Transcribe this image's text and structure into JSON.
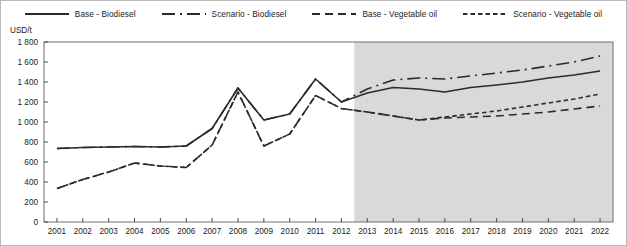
{
  "chart_data": {
    "type": "line",
    "title": "",
    "xlabel": "",
    "ylabel": "USD/t",
    "ylim": [
      0,
      1800
    ],
    "ytick_step": 200,
    "yticks": [
      "0",
      "200",
      "400",
      "600",
      "800",
      "1 000",
      "1 200",
      "1 400",
      "1 600",
      "1 800"
    ],
    "grid": false,
    "legend_position": "top",
    "x": [
      2001,
      2002,
      2003,
      2004,
      2005,
      2006,
      2007,
      2008,
      2009,
      2010,
      2011,
      2012,
      2013,
      2014,
      2015,
      2016,
      2017,
      2018,
      2019,
      2020,
      2021,
      2022
    ],
    "xtick_labels": [
      "2001",
      "2002",
      "2003",
      "2004",
      "2005",
      "2006",
      "2007",
      "2008",
      "2009",
      "2010",
      "2011",
      "2012",
      "2013",
      "2014",
      "2015",
      "2016",
      "2017",
      "2018",
      "2019",
      "2020",
      "2021",
      "2022"
    ],
    "projection_start_year": 2012.5,
    "projection_shading_color": "#d9d9d9",
    "line_color": "#2b2b2b",
    "series": [
      {
        "name": "Base - Biodiesel",
        "style": "solid",
        "values": [
          735,
          745,
          750,
          755,
          750,
          760,
          935,
          1340,
          1020,
          1080,
          1430,
          1200,
          1290,
          1345,
          1330,
          1300,
          1345,
          1370,
          1400,
          1440,
          1470,
          1510
        ]
      },
      {
        "name": "Scenario - Biodiesel",
        "style": "dashdot",
        "values": [
          735,
          745,
          750,
          755,
          750,
          760,
          935,
          1340,
          1020,
          1080,
          1430,
          1200,
          1330,
          1420,
          1440,
          1430,
          1460,
          1490,
          1520,
          1560,
          1600,
          1660
        ]
      },
      {
        "name": "Base - Vegetable oil",
        "style": "longdash",
        "values": [
          335,
          425,
          500,
          590,
          560,
          545,
          770,
          1300,
          760,
          880,
          1265,
          1135,
          1100,
          1060,
          1020,
          1040,
          1050,
          1060,
          1080,
          1100,
          1130,
          1160
        ]
      },
      {
        "name": "Scenario - Vegetable oil",
        "style": "shortdash",
        "values": [
          335,
          425,
          500,
          590,
          560,
          545,
          770,
          1300,
          760,
          880,
          1265,
          1135,
          1100,
          1060,
          1020,
          1050,
          1080,
          1110,
          1150,
          1190,
          1230,
          1280
        ]
      }
    ]
  },
  "legend": {
    "items": [
      {
        "label": "Base - Biodiesel",
        "style": "solid"
      },
      {
        "label": "Scenario - Biodiesel",
        "style": "dashdot"
      },
      {
        "label": "Base - Vegetable oil",
        "style": "longdash"
      },
      {
        "label": "Scenario - Vegetable oil",
        "style": "shortdash"
      }
    ]
  },
  "axis": {
    "y_unit_label": "USD/t"
  }
}
